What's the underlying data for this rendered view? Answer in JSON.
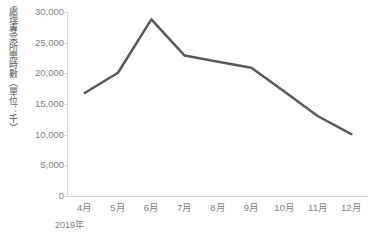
{
  "chart_data": {
    "type": "line",
    "title": "",
    "subtitle": "",
    "xlabel": "2019年",
    "ylabel": "處理專案所需時數（單位：千）",
    "categories": [
      "4月",
      "5月",
      "6月",
      "7月",
      "8月",
      "9月",
      "10月",
      "11月",
      "12月"
    ],
    "values": [
      16800,
      20100,
      28800,
      22900,
      21900,
      20900,
      17000,
      13000,
      10100
    ],
    "series": [
      {
        "name": "處理專案所需時數",
        "values": [
          16800,
          20100,
          28800,
          22900,
          21900,
          20900,
          17000,
          13000,
          10100
        ],
        "color": "#595959"
      }
    ],
    "ylim": [
      0,
      30000
    ],
    "y_ticks": [
      0,
      5000,
      10000,
      15000,
      20000,
      25000,
      30000
    ],
    "y_tick_labels": [
      "0",
      "5,000",
      "10,000",
      "15,000",
      "20,000",
      "25,000",
      "30,000"
    ],
    "grid": false,
    "legend": false,
    "legend_position": "none",
    "markers": false,
    "line_width": 2.5,
    "axis_color": "#d9d9d9",
    "tick_label_color": "#7f7f7f",
    "axis_title_color": "#595959",
    "background": "#ffffff"
  }
}
